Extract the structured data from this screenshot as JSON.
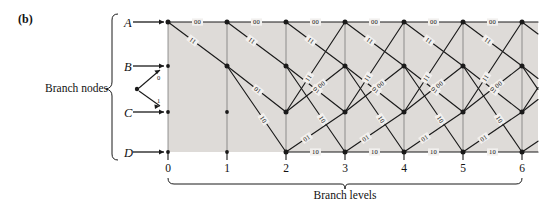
{
  "figure": {
    "panel_label": "(b)",
    "branch_nodes_label": "Branch nodes",
    "branch_levels_label": "Branch levels",
    "shade_color": "#dedbd8",
    "line_color": "#1a1a1a",
    "background": "#ffffff"
  },
  "states": [
    {
      "id": "A",
      "label": "A",
      "y": 22
    },
    {
      "id": "B",
      "label": "B",
      "y": 66
    },
    {
      "id": "C",
      "label": "C",
      "y": 112
    },
    {
      "id": "D",
      "label": "D",
      "y": 152
    }
  ],
  "levels": [
    {
      "label": "0",
      "x": 168
    },
    {
      "label": "1",
      "x": 227
    },
    {
      "label": "2",
      "x": 286
    },
    {
      "label": "3",
      "x": 345
    },
    {
      "label": "4",
      "x": 404
    },
    {
      "label": "5",
      "x": 463
    },
    {
      "label": "6",
      "x": 522
    }
  ],
  "fork": {
    "input_zero_label": "0",
    "input_one_label": "1"
  },
  "transitions": [
    {
      "from": "A",
      "to": "A",
      "output": "00"
    },
    {
      "from": "A",
      "to": "B",
      "output": "11"
    },
    {
      "from": "B",
      "to": "C",
      "output": "01"
    },
    {
      "from": "B",
      "to": "D",
      "output": "10"
    },
    {
      "from": "C",
      "to": "A",
      "output": "11"
    },
    {
      "from": "C",
      "to": "B",
      "output": "00"
    },
    {
      "from": "D",
      "to": "C",
      "output": "01"
    },
    {
      "from": "D",
      "to": "D",
      "output": "10"
    }
  ],
  "sections": [
    {
      "from_level": 0,
      "to_level": 1,
      "active_states": [
        "A"
      ]
    },
    {
      "from_level": 1,
      "to_level": 2,
      "active_states": [
        "A",
        "B"
      ]
    },
    {
      "from_level": 2,
      "to_level": 3,
      "active_states": [
        "A",
        "B",
        "C",
        "D"
      ]
    },
    {
      "from_level": 3,
      "to_level": 4,
      "active_states": [
        "A",
        "B",
        "C",
        "D"
      ]
    },
    {
      "from_level": 4,
      "to_level": 5,
      "active_states": [
        "A",
        "B",
        "C",
        "D"
      ]
    },
    {
      "from_level": 5,
      "to_level": 6,
      "active_states": [
        "A",
        "B",
        "C",
        "D"
      ]
    },
    {
      "from_level": 6,
      "to_level": 7,
      "active_states": [
        "A",
        "B",
        "C",
        "D"
      ]
    }
  ],
  "chart_data": {
    "type": "diagram",
    "xlabel": "Branch levels",
    "ylabel": "Branch nodes",
    "x_ticks": [
      "0",
      "1",
      "2",
      "3",
      "4",
      "5",
      "6"
    ],
    "y_ticks": [
      "A",
      "B",
      "C",
      "D"
    ],
    "edge_labels": [
      "00",
      "11",
      "01",
      "10",
      "11",
      "00",
      "01",
      "10"
    ]
  }
}
